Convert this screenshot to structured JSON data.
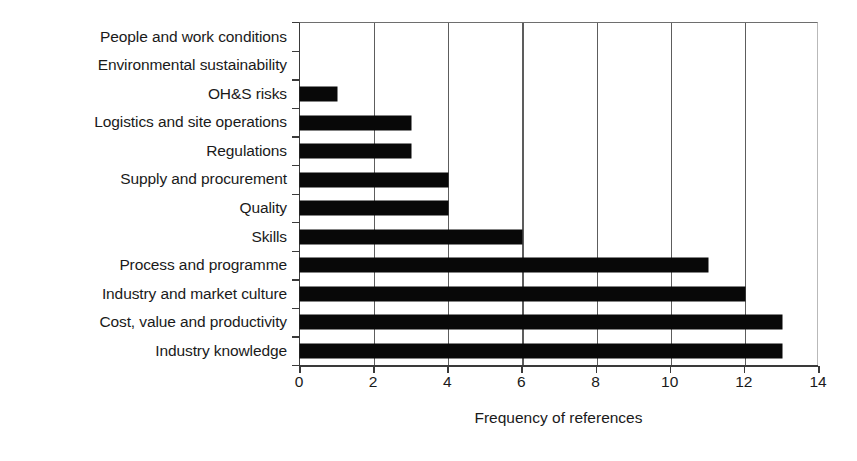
{
  "chart_data": {
    "type": "bar",
    "orientation": "horizontal",
    "title": "",
    "xlabel": "Frequency of references",
    "ylabel": "",
    "xlim": [
      0,
      14
    ],
    "xticks": [
      0,
      2,
      4,
      6,
      8,
      10,
      12,
      14
    ],
    "xtick_labels": [
      "0",
      "2",
      "4",
      "6",
      "8",
      "10",
      "12",
      "14"
    ],
    "grid": "vertical",
    "legend": "none",
    "bar_color": "#080808",
    "background_color": "#ffffff",
    "axis_color": "#3a3a3a",
    "categories": [
      "People and work conditions",
      "Environmental sustainability",
      "OH&S risks",
      "Logistics and site operations",
      "Regulations",
      "Supply and procurement",
      "Quality",
      "Skills",
      "Process and programme",
      "Industry and market culture",
      "Cost, value and productivity",
      "Industry knowledge"
    ],
    "values": [
      0,
      0,
      1,
      3,
      3,
      4,
      4,
      6,
      11,
      12,
      13,
      13
    ]
  }
}
